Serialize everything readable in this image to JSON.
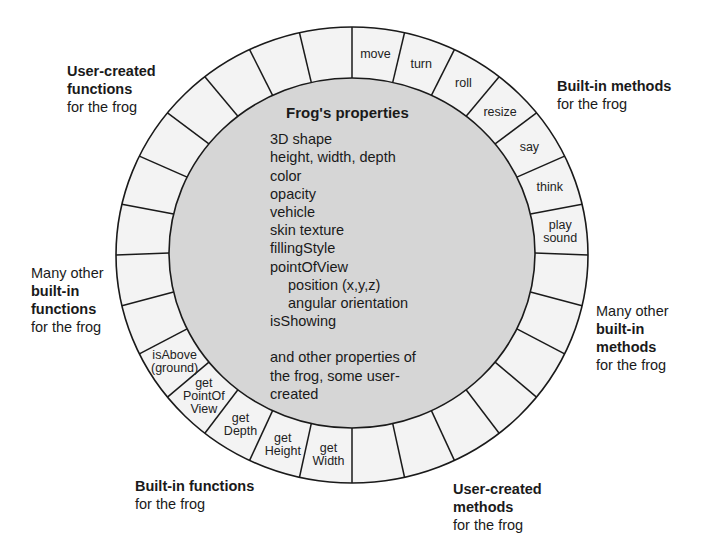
{
  "center": {
    "title": "Frog's properties",
    "items": [
      {
        "text": "3D shape",
        "indent": false
      },
      {
        "text": "height, width, depth",
        "indent": false
      },
      {
        "text": "color",
        "indent": false
      },
      {
        "text": "opacity",
        "indent": false
      },
      {
        "text": "vehicle",
        "indent": false
      },
      {
        "text": "skin texture",
        "indent": false
      },
      {
        "text": "fillingStyle",
        "indent": false
      },
      {
        "text": "pointOfView",
        "indent": false
      },
      {
        "text": "position (x,y,z)",
        "indent": true
      },
      {
        "text": "angular orientation",
        "indent": true
      },
      {
        "text": "isShowing",
        "indent": false
      }
    ],
    "footer": [
      "and other properties of",
      "the frog, some user-",
      "created"
    ]
  },
  "ring": {
    "segment_count": 28,
    "segments": [
      {
        "index": 0,
        "lines": [
          "move"
        ]
      },
      {
        "index": 1,
        "lines": [
          "turn"
        ]
      },
      {
        "index": 2,
        "lines": [
          "roll"
        ]
      },
      {
        "index": 3,
        "lines": [
          "resize"
        ]
      },
      {
        "index": 4,
        "lines": [
          "say"
        ]
      },
      {
        "index": 5,
        "lines": [
          "think"
        ]
      },
      {
        "index": 6,
        "lines": [
          "play",
          "sound"
        ]
      },
      {
        "index": 14,
        "lines": [
          "get",
          "Width"
        ]
      },
      {
        "index": 15,
        "lines": [
          "get",
          "Height"
        ]
      },
      {
        "index": 16,
        "lines": [
          "get",
          "Depth"
        ]
      },
      {
        "index": 17,
        "lines": [
          "get",
          "PointOf",
          "View"
        ]
      },
      {
        "index": 18,
        "lines": [
          "isAbove",
          "(ground)"
        ]
      }
    ],
    "colors": {
      "ring_fill": "#f3f3f3",
      "core_fill": "#d6d6d6",
      "stroke": "#1a1a1a"
    }
  },
  "callouts": {
    "user_created_functions": {
      "bold": [
        "User-created",
        "functions"
      ],
      "normal": [
        "for the frog"
      ]
    },
    "built_in_methods": {
      "bold": [
        "Built-in methods"
      ],
      "normal": [
        "for the frog"
      ]
    },
    "many_builtin_functions": {
      "pre": "Many other",
      "bold": [
        "built-in",
        "functions"
      ],
      "normal": [
        "for the frog"
      ]
    },
    "many_builtin_methods": {
      "pre": "Many other",
      "bold": [
        "built-in",
        "methods"
      ],
      "normal": [
        "for the frog"
      ]
    },
    "built_in_functions": {
      "bold": [
        "Built-in functions"
      ],
      "normal": [
        "for the frog"
      ]
    },
    "user_created_methods": {
      "bold": [
        "User-created",
        "methods"
      ],
      "normal": [
        "for the frog"
      ]
    }
  }
}
